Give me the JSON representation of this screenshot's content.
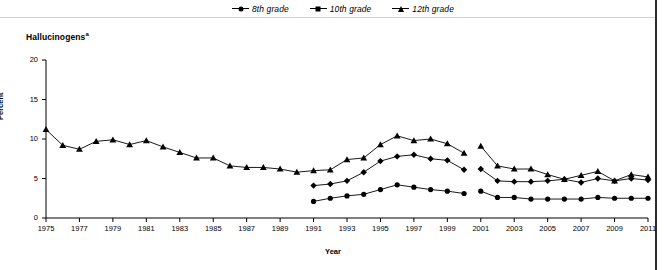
{
  "legend": {
    "items": [
      {
        "label": "8th grade",
        "marker": "circle-marker-icon"
      },
      {
        "label": "10th grade",
        "marker": "diamond-marker-icon"
      },
      {
        "label": "12th grade",
        "marker": "triangle-marker-icon"
      }
    ]
  },
  "title": {
    "text": "Hallucinogens",
    "footnote_marker": "a"
  },
  "axes": {
    "ylabel": "Percent",
    "xlabel": "Year",
    "yticks": [
      "0",
      "5",
      "10",
      "15",
      "20"
    ],
    "xticks": [
      "1975",
      "1977",
      "1979",
      "1981",
      "1983",
      "1985",
      "1987",
      "1989",
      "1991",
      "1993",
      "1995",
      "1997",
      "1999",
      "2001",
      "2003",
      "2005",
      "2007",
      "2009",
      "2011"
    ]
  },
  "chart_data": {
    "type": "line",
    "title": "Hallucinogens",
    "xlabel": "Year",
    "ylabel": "Percent",
    "ylim": [
      0,
      20
    ],
    "xlim": [
      1975,
      2011
    ],
    "grid": false,
    "legend_position": "top-center",
    "x": [
      1975,
      1976,
      1977,
      1978,
      1979,
      1980,
      1981,
      1982,
      1983,
      1984,
      1985,
      1986,
      1987,
      1988,
      1989,
      1990,
      1991,
      1992,
      1993,
      1994,
      1995,
      1996,
      1997,
      1998,
      1999,
      2000,
      2001,
      2002,
      2003,
      2004,
      2005,
      2006,
      2007,
      2008,
      2009,
      2010,
      2011
    ],
    "series": [
      {
        "name": "8th grade",
        "marker": "circle",
        "x": [
          1991,
          1992,
          1993,
          1994,
          1995,
          1996,
          1997,
          1998,
          1999,
          2000,
          2001,
          2002,
          2003,
          2004,
          2005,
          2006,
          2007,
          2008,
          2009,
          2010,
          2011
        ],
        "values": [
          2.1,
          2.5,
          2.8,
          3.0,
          3.6,
          4.2,
          3.9,
          3.6,
          3.4,
          3.1,
          3.4,
          2.6,
          2.6,
          2.4,
          2.4,
          2.4,
          2.4,
          2.6,
          2.5,
          2.5,
          2.5
        ],
        "break_after": 2000
      },
      {
        "name": "10th grade",
        "marker": "diamond",
        "x": [
          1991,
          1992,
          1993,
          1994,
          1995,
          1996,
          1997,
          1998,
          1999,
          2000,
          2001,
          2002,
          2003,
          2004,
          2005,
          2006,
          2007,
          2008,
          2009,
          2010,
          2011
        ],
        "values": [
          4.1,
          4.3,
          4.7,
          5.8,
          7.2,
          7.8,
          8.0,
          7.5,
          7.3,
          6.1,
          6.2,
          4.7,
          4.6,
          4.6,
          4.7,
          4.9,
          4.5,
          5.0,
          4.7,
          5.0,
          4.8
        ],
        "break_after": 2000
      },
      {
        "name": "12th grade",
        "marker": "triangle",
        "x": [
          1975,
          1976,
          1977,
          1978,
          1979,
          1980,
          1981,
          1982,
          1983,
          1984,
          1985,
          1986,
          1987,
          1988,
          1989,
          1990,
          1991,
          1992,
          1993,
          1994,
          1995,
          1996,
          1997,
          1998,
          1999,
          2000,
          2001,
          2002,
          2003,
          2004,
          2005,
          2006,
          2007,
          2008,
          2009,
          2010,
          2011
        ],
        "values": [
          11.2,
          9.2,
          8.7,
          9.7,
          9.9,
          9.3,
          9.8,
          9.0,
          8.3,
          7.6,
          7.6,
          6.6,
          6.4,
          6.4,
          6.2,
          5.8,
          6.0,
          6.1,
          7.4,
          7.6,
          9.3,
          10.4,
          9.8,
          10.0,
          9.4,
          8.2,
          9.1,
          6.6,
          6.2,
          6.2,
          5.5,
          4.9,
          5.4,
          5.9,
          4.7,
          5.5,
          5.2
        ],
        "break_after": 2000
      }
    ]
  }
}
